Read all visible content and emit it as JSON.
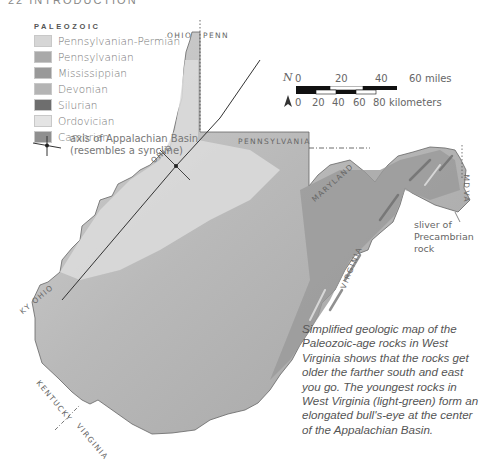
{
  "page_header": "22 INTRODUCTION",
  "legend": {
    "title": "PALEOZOIC",
    "items": [
      {
        "label": "Pennsylvanian-Permian",
        "color": "#d6d6d6"
      },
      {
        "label": "Pennsylvanian",
        "color": "#a9a9a9"
      },
      {
        "label": "Mississippian",
        "color": "#999999"
      },
      {
        "label": "Devonian",
        "color": "#b4b4b4"
      },
      {
        "label": "Silurian",
        "color": "#6e6e6e"
      },
      {
        "label": "Ordovician",
        "color": "#e4e4e4"
      },
      {
        "label": "Cambrian",
        "color": "#8f8f8f"
      }
    ],
    "axis_label_line1": "axis of Appalachian Basin",
    "axis_label_line2": "(resembles a syncline)"
  },
  "scale": {
    "north_symbol": "N",
    "miles_ticks": [
      "0",
      "20",
      "40",
      "60 miles"
    ],
    "km_ticks": [
      "0",
      "20",
      "40",
      "60",
      "80 kilometers"
    ]
  },
  "map_labels": {
    "ohio_top": "OHIO",
    "penn_top": "PENN",
    "pennsylvania": "PENNSYLVANIA",
    "ohio_river": "OHIO",
    "maryland": "MARYLAND",
    "md": "MD",
    "va": "VA",
    "virginia_east": "VIRGINIA",
    "ky_ohio": "KY OHIO",
    "kentucky": "KENTUCKY",
    "virginia_south": "VIRGINIA"
  },
  "sliver_note": {
    "line1": "sliver of",
    "line2": "Precambrian",
    "line3": "rock"
  },
  "caption": "Simplified geologic map of the Paleozoic-age rocks in West Virginia shows that the rocks get older the farther south and east you go. The youngest rocks in West Virginia (light-green) form an elongated bull's-eye at the center of the Appalachian Basin."
}
